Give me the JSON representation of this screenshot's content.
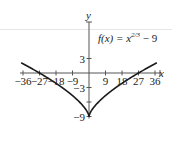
{
  "chart_data": {
    "type": "line",
    "title": "",
    "function_label": "f(x) = x^(2/3) − 9",
    "function_label_parts": {
      "prefix": "f(x) = x",
      "exponent": "2/3",
      "suffix": " − 9"
    },
    "xlabel": "x",
    "ylabel": "y",
    "xlim": [
      -40,
      40
    ],
    "ylim": [
      -9,
      6
    ],
    "x_ticks": [
      -36,
      -27,
      -18,
      -9,
      9,
      18,
      27,
      36
    ],
    "x_tick_labels": [
      "−36",
      "−27",
      "−18",
      "−9",
      "9",
      "18",
      "27",
      "36"
    ],
    "y_ticks": [
      3,
      -3,
      -9
    ],
    "y_tick_labels": [
      "3",
      "−3",
      "−9"
    ],
    "grid": false,
    "legend": null,
    "series": [
      {
        "name": "f(x) = x^(2/3) − 9",
        "x": [
          -36,
          -27,
          -18,
          -9,
          -1,
          0,
          1,
          9,
          18,
          27,
          36
        ],
        "values": [
          1.9,
          0,
          -2.13,
          -4.67,
          -8,
          -9,
          -8,
          -4.67,
          -2.13,
          0,
          1.9
        ]
      }
    ],
    "key_points": [
      {
        "x": -27,
        "y": 0,
        "note": "x-intercept"
      },
      {
        "x": 27,
        "y": 0,
        "note": "x-intercept"
      },
      {
        "x": 0,
        "y": -9,
        "note": "cusp / minimum"
      }
    ],
    "colors": {
      "curve": "#1a1a1a",
      "axis": "#555555"
    }
  }
}
